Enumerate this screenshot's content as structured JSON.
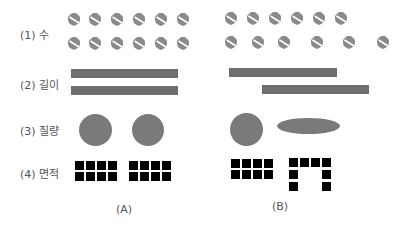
{
  "rows": [
    {
      "label": "(1) 수",
      "concept": "number"
    },
    {
      "label": "(2) 길이",
      "concept": "length"
    },
    {
      "label": "(3) 질량",
      "concept": "mass"
    },
    {
      "label": "(4) 면적",
      "concept": "area"
    }
  ],
  "columns": {
    "A": {
      "caption": "(A)"
    },
    "B": {
      "caption": "(B)"
    }
  },
  "colors": {
    "acorn": "#8a8a8a",
    "bar": "#6e6e6e",
    "blob": "#7a7a7a",
    "square": "#000000",
    "text": "#555555"
  },
  "counts": {
    "acorns_per_row": 6,
    "squares_per_figure": 8
  },
  "icons": {
    "acorn": "acorn-icon"
  }
}
